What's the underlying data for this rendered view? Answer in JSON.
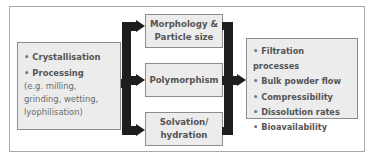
{
  "diagram": {
    "left_box": {
      "items": [
        {
          "bullet": "•",
          "label": "Crystallisation"
        },
        {
          "bullet": "•",
          "label": "Processing"
        }
      ],
      "sub_lines": [
        "(e.g. milling,",
        "grinding, wetting,",
        "lyophilisation)"
      ]
    },
    "middle_boxes": [
      {
        "lines": [
          "Morphology &",
          "Particle size"
        ]
      },
      {
        "lines": [
          "Polymorphism"
        ]
      },
      {
        "lines": [
          "Solvation/",
          "hydration"
        ]
      }
    ],
    "right_box": {
      "items": [
        {
          "bullet": "•",
          "label": "Filtration processes"
        },
        {
          "bullet": "•",
          "label": "Bulk powder flow"
        },
        {
          "bullet": "•",
          "label": "Compressibility"
        },
        {
          "bullet": "•",
          "label": "Dissolution rates"
        },
        {
          "bullet": "•",
          "label": "Bioavailability"
        }
      ]
    },
    "colors": {
      "box_fill": "#ececec",
      "box_border": "#8c8c8c",
      "arrow": "#1e1e1e",
      "text": "#555555"
    }
  }
}
